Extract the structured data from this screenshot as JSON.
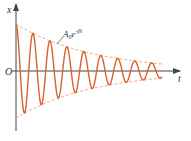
{
  "diagram": {
    "axis_labels": {
      "y": "x",
      "x": "t",
      "origin": "O"
    },
    "envelope_label": {
      "base": "A",
      "subscript": "0",
      "e": "e",
      "exponent": "-βt"
    },
    "colors": {
      "curve": "#d9622b",
      "envelope": "#e8906a",
      "axis": "#444444"
    },
    "oscillation": {
      "cycles_shown": 8.6,
      "decay_ratio_end_to_start": 0.15,
      "phase": "cosine"
    }
  }
}
